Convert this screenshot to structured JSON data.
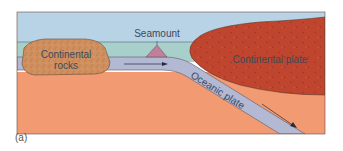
{
  "figure": {
    "caption": "(a)",
    "labels": {
      "seamount": "Seamount",
      "continental_rocks_line1": "Continental",
      "continental_rocks_line2": "rocks",
      "continental_plate": "Continental plate",
      "oceanic_plate": "Oceanic plate"
    },
    "colors": {
      "sky": "#b9d3e6",
      "ocean": "#a9cfca",
      "mantle": "#f29a72",
      "oceanic_plate": "#b3b8d3",
      "continental_plate": "#c0452e",
      "continental_rocks": "#cf8f5e",
      "seamount": "#c0809a",
      "outline": "#5a4a44"
    }
  }
}
